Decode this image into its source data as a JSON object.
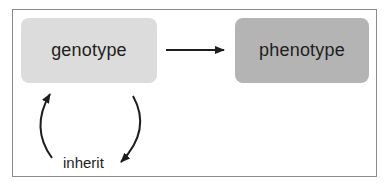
{
  "diagram": {
    "nodes": [
      {
        "id": "genotype",
        "label": "genotype",
        "fill": "#dcdcdc"
      },
      {
        "id": "phenotype",
        "label": "phenotype",
        "fill": "#b4b4b4"
      }
    ],
    "edges": [
      {
        "from": "genotype",
        "to": "phenotype",
        "type": "straight-arrow"
      },
      {
        "from": "genotype",
        "to": "genotype",
        "type": "cycle",
        "label": "inherit"
      }
    ],
    "cycle_label": "inherit",
    "colors": {
      "frame_border": "#8a8a8a",
      "arrow": "#1e1e1e",
      "text": "#1e1e1e"
    }
  }
}
